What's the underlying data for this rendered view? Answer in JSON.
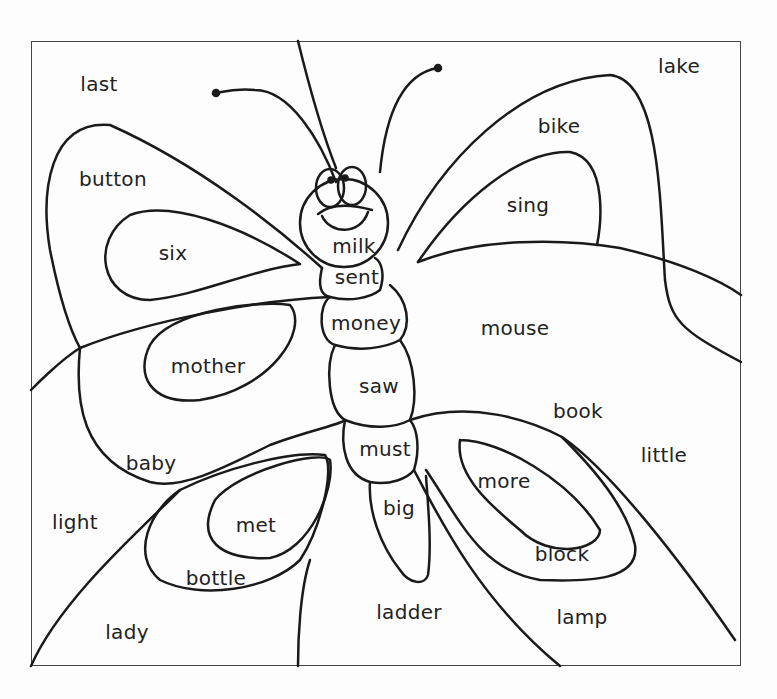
{
  "worksheet": {
    "subject": "butterfly coloring page",
    "words": [
      {
        "text": "last",
        "x": 99,
        "y": 84
      },
      {
        "text": "lake",
        "x": 679,
        "y": 66
      },
      {
        "text": "bike",
        "x": 559,
        "y": 126
      },
      {
        "text": "button",
        "x": 113,
        "y": 179
      },
      {
        "text": "sing",
        "x": 528,
        "y": 205
      },
      {
        "text": "six",
        "x": 173,
        "y": 253
      },
      {
        "text": "milk",
        "x": 354,
        "y": 246
      },
      {
        "text": "sent",
        "x": 357,
        "y": 277
      },
      {
        "text": "money",
        "x": 366,
        "y": 323
      },
      {
        "text": "mouse",
        "x": 515,
        "y": 328
      },
      {
        "text": "mother",
        "x": 208,
        "y": 366
      },
      {
        "text": "saw",
        "x": 379,
        "y": 386
      },
      {
        "text": "book",
        "x": 578,
        "y": 411
      },
      {
        "text": "must",
        "x": 385,
        "y": 449
      },
      {
        "text": "little",
        "x": 664,
        "y": 455
      },
      {
        "text": "baby",
        "x": 151,
        "y": 463
      },
      {
        "text": "more",
        "x": 504,
        "y": 481
      },
      {
        "text": "big",
        "x": 399,
        "y": 508
      },
      {
        "text": "light",
        "x": 75,
        "y": 522
      },
      {
        "text": "met",
        "x": 256,
        "y": 525
      },
      {
        "text": "block",
        "x": 562,
        "y": 554
      },
      {
        "text": "bottle",
        "x": 216,
        "y": 578
      },
      {
        "text": "ladder",
        "x": 409,
        "y": 612
      },
      {
        "text": "lamp",
        "x": 582,
        "y": 617
      },
      {
        "text": "lady",
        "x": 127,
        "y": 632
      }
    ]
  }
}
